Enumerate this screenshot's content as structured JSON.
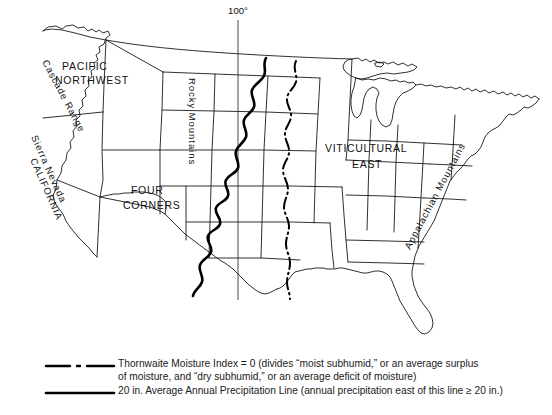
{
  "figure": {
    "type": "thematic-map",
    "meridian_label": "100°"
  },
  "map_labels": {
    "regions": [
      {
        "name": "pacific-northwest",
        "line1": "PACIFIC",
        "line2": "NORTHWEST"
      },
      {
        "name": "four-corners",
        "line1": "FOUR",
        "line2": "CORNERS"
      },
      {
        "name": "viticultural-east",
        "line1": "VITICULTURAL",
        "line2": "EAST"
      },
      {
        "name": "california",
        "line1": "CALIFORNIA"
      }
    ],
    "ranges": [
      {
        "name": "cascade-range",
        "text": "Cascade Range"
      },
      {
        "name": "sierra-nevada",
        "text": "Sierra Nevada"
      },
      {
        "name": "rocky-mountains",
        "text": "Rocky Mountains"
      },
      {
        "name": "appalachian-mountains",
        "text": "Appalachian Mountains"
      }
    ]
  },
  "legend": {
    "items": [
      {
        "symbol": "dash-dot-line",
        "text": "Thornwaite Moisture Index = 0 (divides “moist subhumid,” or an average surplus\nof moisture, and “dry subhumid,” or an average deficit of moisture)"
      },
      {
        "symbol": "solid-line",
        "text": "20 in. Average Annual Precipitation Line (annual precipitation east of this line ≥ 20 in.)"
      }
    ]
  },
  "colors": {
    "ink": "#1a1a1a",
    "background": "#ffffff"
  }
}
